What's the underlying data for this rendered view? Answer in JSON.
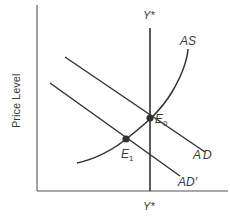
{
  "diagram": {
    "type": "aggregate-demand-aggregate-supply",
    "y_axis_label": "Price Level",
    "x_axis_label": "",
    "curves": {
      "as": {
        "label": "AS"
      },
      "ad": {
        "label": "AD"
      },
      "ad_prime": {
        "label": "AD′"
      },
      "potential_output": {
        "label_top": "Y*",
        "label_bottom": "Y*"
      }
    },
    "points": {
      "e0": {
        "label": "E",
        "subscript": "0"
      },
      "e1": {
        "label": "E",
        "subscript": "1"
      }
    }
  }
}
